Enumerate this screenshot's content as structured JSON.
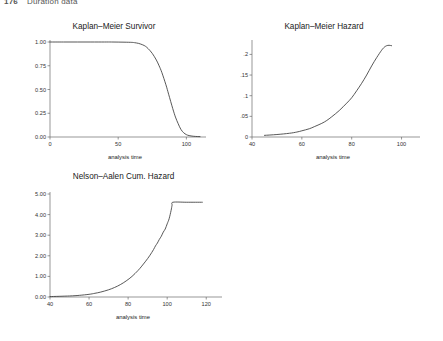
{
  "page": {
    "number": "176",
    "header_title": "Duration data"
  },
  "panels": [
    {
      "name": "kaplan-meier-survivor",
      "title": "Kaplan–Meier Survivor",
      "xlabel": "analysis time",
      "ylabel": "",
      "xticks": [
        "0",
        "50",
        "100"
      ],
      "yticks": [
        "1.00",
        "0.75",
        "0.50",
        "0.25",
        "0.00"
      ]
    },
    {
      "name": "kaplan-meier-hazard",
      "title": "Kaplan–Meier Hazard",
      "xlabel": "analysis time",
      "ylabel": "",
      "xticks": [
        "40",
        "60",
        "80",
        "100"
      ],
      "yticks": [
        ".2",
        ".15",
        ".1",
        ".05",
        "0"
      ]
    },
    {
      "name": "nelson-aalen-cumulative-hazard",
      "title": "Nelson–Aalen Cum. Hazard",
      "xlabel": "analysis time",
      "ylabel": "",
      "xticks": [
        "40",
        "60",
        "80",
        "100",
        "120"
      ],
      "yticks": [
        "5.00",
        "4.00",
        "3.00",
        "2.00",
        "1.00",
        "0.00"
      ]
    }
  ],
  "colors": {
    "line": "#3a3a3a",
    "axis": "#6a6a6a",
    "background": "#ffffff",
    "text": "#1a1a1a"
  },
  "chart_data": [
    {
      "type": "line",
      "name": "kaplan-meier-survivor",
      "title": "Kaplan–Meier Survivor",
      "xlabel": "analysis time",
      "ylabel": "",
      "xlim": [
        0,
        110
      ],
      "ylim": [
        0,
        1.0
      ],
      "xticks": [
        0,
        50,
        100
      ],
      "yticks": [
        0.0,
        0.25,
        0.5,
        0.75,
        1.0
      ],
      "grid": false,
      "legend": "none",
      "x": [
        0,
        10,
        20,
        30,
        40,
        45,
        50,
        55,
        60,
        62,
        65,
        68,
        70,
        72,
        75,
        78,
        80,
        82,
        85,
        87,
        90,
        92,
        94,
        96,
        98,
        100,
        102,
        105,
        108,
        110
      ],
      "y": [
        1.0,
        1.0,
        1.0,
        1.0,
        1.0,
        1.0,
        0.999,
        0.998,
        0.996,
        0.993,
        0.985,
        0.97,
        0.955,
        0.93,
        0.88,
        0.81,
        0.75,
        0.68,
        0.55,
        0.45,
        0.3,
        0.21,
        0.14,
        0.08,
        0.045,
        0.025,
        0.015,
        0.008,
        0.005,
        0.004
      ]
    },
    {
      "type": "line",
      "name": "kaplan-meier-hazard",
      "title": "Kaplan–Meier Hazard",
      "xlabel": "analysis time",
      "ylabel": "",
      "xlim": [
        40,
        105
      ],
      "ylim": [
        0,
        0.23
      ],
      "xticks": [
        40,
        60,
        80,
        100
      ],
      "yticks": [
        0,
        0.05,
        0.1,
        0.15,
        0.2
      ],
      "grid": false,
      "legend": "none",
      "x": [
        45,
        50,
        55,
        58,
        60,
        63,
        65,
        68,
        70,
        72,
        75,
        78,
        80,
        82,
        84,
        86,
        88,
        90,
        92,
        93,
        94,
        95,
        96
      ],
      "y": [
        0.004,
        0.006,
        0.009,
        0.012,
        0.015,
        0.02,
        0.025,
        0.033,
        0.04,
        0.049,
        0.064,
        0.082,
        0.095,
        0.112,
        0.13,
        0.15,
        0.172,
        0.192,
        0.21,
        0.217,
        0.221,
        0.222,
        0.221
      ]
    },
    {
      "type": "line",
      "name": "nelson-aalen-cumulative-hazard",
      "title": "Nelson–Aalen Cum. Hazard",
      "xlabel": "analysis time",
      "ylabel": "",
      "xlim": [
        40,
        125
      ],
      "ylim": [
        0,
        5.0
      ],
      "xticks": [
        40,
        60,
        80,
        100,
        120
      ],
      "yticks": [
        0.0,
        1.0,
        2.0,
        3.0,
        4.0,
        5.0
      ],
      "grid": false,
      "legend": "none",
      "x": [
        40,
        50,
        55,
        60,
        63,
        66,
        70,
        73,
        76,
        79,
        82,
        85,
        87,
        89,
        91,
        93,
        94,
        95,
        96,
        97,
        98,
        99,
        100,
        101,
        102,
        102.5,
        103,
        110,
        118
      ],
      "y": [
        0.02,
        0.05,
        0.08,
        0.13,
        0.18,
        0.24,
        0.35,
        0.46,
        0.6,
        0.78,
        1.0,
        1.28,
        1.5,
        1.74,
        2.0,
        2.3,
        2.48,
        2.62,
        2.8,
        2.95,
        3.15,
        3.3,
        3.55,
        3.8,
        4.2,
        4.45,
        4.6,
        4.6,
        4.6
      ]
    }
  ]
}
